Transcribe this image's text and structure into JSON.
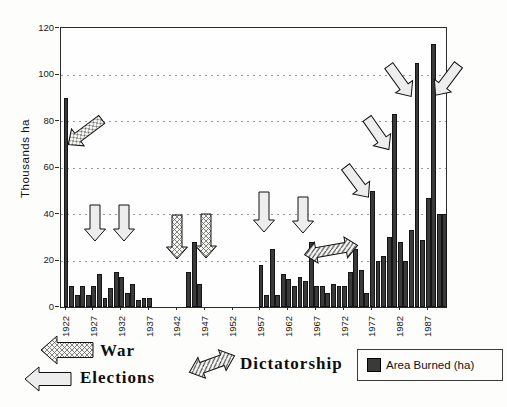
{
  "chart_data": {
    "type": "bar",
    "title": "",
    "ylabel": "Thousands ha",
    "xlabel": "",
    "ylim": [
      0,
      120
    ],
    "yticks": [
      0,
      20,
      40,
      60,
      80,
      100,
      120
    ],
    "xticks": [
      1922,
      1927,
      1932,
      1937,
      1942,
      1947,
      1952,
      1957,
      1962,
      1967,
      1972,
      1977,
      1982,
      1987
    ],
    "grid": "horizontal-dotted",
    "legend_position": "bottom",
    "series_name": "Area Burned (ha)",
    "categories": [
      1922,
      1923,
      1924,
      1925,
      1926,
      1927,
      1928,
      1929,
      1930,
      1931,
      1932,
      1933,
      1934,
      1935,
      1936,
      1937,
      1938,
      1939,
      1940,
      1941,
      1942,
      1943,
      1944,
      1945,
      1946,
      1947,
      1948,
      1949,
      1950,
      1951,
      1952,
      1953,
      1954,
      1955,
      1956,
      1957,
      1958,
      1959,
      1960,
      1961,
      1962,
      1963,
      1964,
      1965,
      1966,
      1967,
      1968,
      1969,
      1970,
      1971,
      1972,
      1973,
      1974,
      1975,
      1976,
      1977,
      1978,
      1979,
      1980,
      1981,
      1982,
      1983,
      1984,
      1985,
      1986,
      1987,
      1988,
      1989,
      1990
    ],
    "values": [
      90,
      9,
      5,
      9,
      5,
      9,
      14,
      4,
      8,
      15,
      13,
      6,
      10,
      3,
      4,
      4,
      0,
      0,
      0,
      0,
      0,
      0,
      15,
      28,
      10,
      0,
      0,
      0,
      0,
      0,
      0,
      0,
      0,
      0,
      0,
      18,
      5,
      25,
      5,
      14,
      12,
      9,
      13,
      11,
      28,
      9,
      9,
      6,
      10,
      9,
      9,
      15,
      25,
      16,
      6,
      50,
      20,
      22,
      30,
      83,
      28,
      20,
      33,
      105,
      29,
      47,
      113,
      40,
      40
    ],
    "annotations": [
      {
        "label": "War",
        "style": "crosshatch",
        "target_year": "1922",
        "cx": 85,
        "cy": 132,
        "angle": 143,
        "len": 42,
        "double": false
      },
      {
        "label": "Elections",
        "style": "open",
        "target_year": "1928",
        "cx": 95,
        "cy": 223,
        "angle": 90,
        "len": 36,
        "double": false
      },
      {
        "label": "Elections",
        "style": "open",
        "target_year": "1933",
        "cx": 124,
        "cy": 223,
        "angle": 90,
        "len": 36,
        "double": false
      },
      {
        "label": "War",
        "style": "crosshatch",
        "target_year": "1944",
        "cx": 177,
        "cy": 237,
        "angle": 90,
        "len": 44,
        "double": false
      },
      {
        "label": "War",
        "style": "crosshatch",
        "target_year": "1946",
        "cx": 206,
        "cy": 236,
        "angle": 90,
        "len": 44,
        "double": false
      },
      {
        "label": "Elections",
        "style": "open",
        "target_year": "1958",
        "cx": 264,
        "cy": 212,
        "angle": 90,
        "len": 40,
        "double": false
      },
      {
        "label": "Elections",
        "style": "open",
        "target_year": "1964",
        "cx": 303,
        "cy": 215,
        "angle": 90,
        "len": 36,
        "double": false
      },
      {
        "label": "Dictatorship",
        "style": "diagonal-hatch",
        "target_year": "1967-1974",
        "cx": 331,
        "cy": 250,
        "angle": -10,
        "len": 54,
        "double": true
      },
      {
        "label": "Elections",
        "style": "open",
        "target_year": "1977",
        "cx": 357,
        "cy": 182,
        "angle": 53,
        "len": 38,
        "double": false
      },
      {
        "label": "Elections",
        "style": "open",
        "target_year": "1981",
        "cx": 378,
        "cy": 134,
        "angle": 55,
        "len": 38,
        "double": false
      },
      {
        "label": "Elections",
        "style": "open",
        "target_year": "1985",
        "cx": 400,
        "cy": 81,
        "angle": 54,
        "len": 38,
        "double": false
      },
      {
        "label": "Elections",
        "style": "open",
        "target_year": "1988",
        "cx": 447,
        "cy": 80,
        "angle": 127,
        "len": 38,
        "double": false
      }
    ],
    "colors": {
      "bar_fill": "#3a3a3a",
      "bar_edge": "#141414",
      "grid": "#9b9b9b",
      "open_arrow_fill": "#ededed",
      "arrow_outline": "#111111"
    }
  },
  "legend": {
    "war_label": "War",
    "elections_label": "Elections",
    "dictatorship_label": "Dictatorship",
    "area_burned_label": "Area Burned (ha)"
  }
}
